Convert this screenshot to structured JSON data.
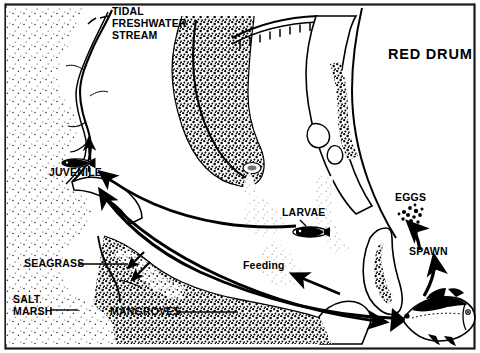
{
  "figure": {
    "title": "RED DRUM",
    "kind": "life-cycle-habitat-map",
    "style": "black-and-white stippled line art",
    "border_color": "#1a1a1a",
    "ink_color": "#000000",
    "background_color": "#ffffff"
  },
  "labels": {
    "title": "RED DRUM",
    "tidal_stream_line1": "TIDAL",
    "tidal_stream_line2": "FRESHWATER",
    "tidal_stream_line3": "STREAM",
    "juvenile": "JUVENILE",
    "seagrass": "SEAGRASS",
    "salt_marsh_line1": "SALT",
    "salt_marsh_line2": "MARSH",
    "mangroves": "MANGROVES",
    "larvae": "LARVAE",
    "eggs": "EGGS",
    "spawn": "SPAWN",
    "feeding": "Feeding"
  },
  "life_stages": [
    {
      "name": "EGGS",
      "icon": "egg-cluster-icon"
    },
    {
      "name": "LARVAE",
      "icon": "larva-icon"
    },
    {
      "name": "JUVENILE",
      "icon": "juvenile-fish-icon"
    },
    {
      "name": "SPAWN",
      "icon": "spawn-arrow-icon"
    },
    {
      "name": "Feeding",
      "icon": "feeding-arrow-icon"
    }
  ],
  "habitats": [
    "TIDAL FRESHWATER STREAM",
    "SEAGRASS",
    "SALT MARSH",
    "MANGROVES"
  ],
  "organisms": [
    {
      "name": "adult-red-drum",
      "stage": "adult"
    },
    {
      "name": "juvenile-red-drum",
      "stage": "juvenile"
    },
    {
      "name": "red-drum-larva",
      "stage": "larva"
    },
    {
      "name": "red-drum-eggs",
      "stage": "egg"
    }
  ],
  "map_features": [
    "bridge-causeway",
    "barrier-island-chain",
    "estuary-bay",
    "marsh-stipple",
    "tidal-creek",
    "mainland-shoreline"
  ]
}
